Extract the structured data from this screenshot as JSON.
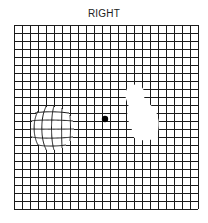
{
  "title": "RIGHT",
  "grid": {
    "x": 14,
    "y": 25,
    "cell": 8,
    "cols": 23,
    "rows": 23,
    "line_color": "#1a1a1a"
  },
  "fixation_dot": {
    "cx": 105,
    "cy": 119,
    "r": 3.2,
    "color": "#000000"
  },
  "distortion_region": {
    "label": "metamorphopsia",
    "cx": 52,
    "cy": 128,
    "rx": 22,
    "ry": 22
  },
  "scotoma_region": {
    "label": "scotoma",
    "color": "#ffffff"
  }
}
